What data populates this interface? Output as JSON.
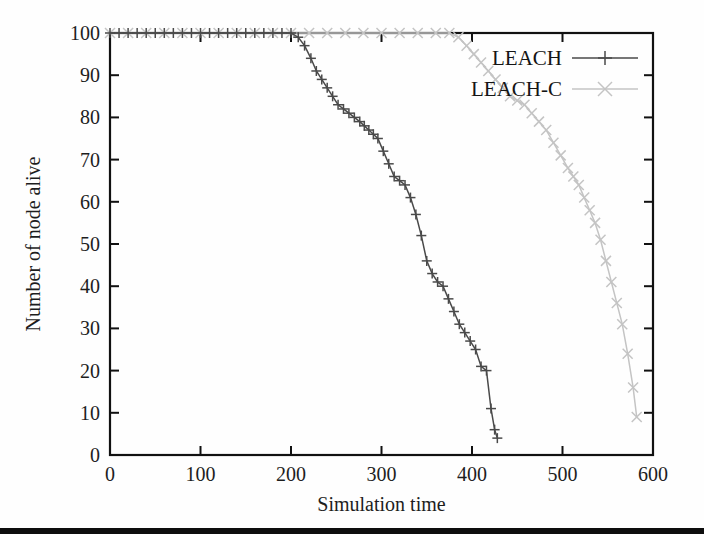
{
  "figure": {
    "background_color": "#fefefe",
    "frame_color": "#111111",
    "bottom_rule_color": "#0d0d0d"
  },
  "chart_data": {
    "type": "line",
    "title": "",
    "subtitle": "",
    "xlabel": "Simulation time",
    "ylabel": "Number of node alive",
    "xlim": [
      0,
      600
    ],
    "ylim": [
      0,
      100
    ],
    "xticks": [
      0,
      100,
      200,
      300,
      400,
      500,
      600
    ],
    "yticks": [
      0,
      10,
      20,
      30,
      40,
      50,
      60,
      70,
      80,
      90,
      100
    ],
    "xtick_labels": [
      "0",
      "100",
      "200",
      "300",
      "400",
      "500",
      "600"
    ],
    "ytick_labels": [
      "0",
      "10",
      "20",
      "30",
      "40",
      "50",
      "60",
      "70",
      "80",
      "90",
      "100"
    ],
    "grid": false,
    "legend_position": "top-right",
    "legend_entries": [
      "LEACH",
      "LEACH-C"
    ],
    "series": [
      {
        "name": "LEACH",
        "color": "#4a4a4a",
        "marker": "plus",
        "x": [
          0,
          10,
          20,
          30,
          40,
          50,
          60,
          70,
          80,
          90,
          100,
          110,
          120,
          130,
          140,
          150,
          160,
          170,
          180,
          190,
          200,
          208,
          215,
          222,
          228,
          234,
          240,
          246,
          252,
          258,
          264,
          270,
          276,
          281,
          286,
          291,
          296,
          302,
          308,
          314,
          320,
          326,
          332,
          338,
          344,
          350,
          356,
          362,
          368,
          374,
          380,
          386,
          392,
          398,
          404,
          410,
          416,
          421,
          425,
          428
        ],
        "y": [
          100,
          100,
          100,
          100,
          100,
          100,
          100,
          100,
          100,
          100,
          100,
          100,
          100,
          100,
          100,
          100,
          100,
          100,
          100,
          100,
          100,
          99,
          97,
          94,
          91,
          89,
          87,
          85,
          83,
          82,
          81,
          80,
          79,
          78,
          77,
          76,
          75,
          72,
          69,
          66,
          65,
          64,
          61,
          57,
          52,
          46,
          43,
          41,
          40,
          37,
          34,
          31,
          29,
          27,
          25,
          21,
          20,
          11,
          6,
          4
        ]
      },
      {
        "name": "LEACH-C",
        "color": "#c4c4c4",
        "marker": "cross",
        "x": [
          0,
          20,
          40,
          60,
          80,
          100,
          120,
          140,
          160,
          180,
          200,
          220,
          240,
          260,
          280,
          300,
          320,
          340,
          360,
          375,
          385,
          394,
          402,
          410,
          418,
          426,
          434,
          442,
          450,
          458,
          466,
          474,
          482,
          490,
          498,
          506,
          512,
          518,
          524,
          530,
          536,
          542,
          548,
          554,
          560,
          566,
          572,
          578,
          582
        ],
        "y": [
          100,
          100,
          100,
          100,
          100,
          100,
          100,
          100,
          100,
          100,
          100,
          100,
          100,
          100,
          100,
          100,
          100,
          100,
          100,
          100,
          99,
          97,
          95,
          93,
          91,
          89,
          87,
          85,
          84,
          83,
          81,
          79,
          77,
          74,
          71,
          68,
          66,
          64,
          61,
          58,
          55,
          51,
          46,
          41,
          36,
          31,
          24,
          16,
          9
        ]
      }
    ]
  },
  "axes": {
    "x_axis_label": "Simulation time",
    "y_axis_label": "Number of node alive"
  },
  "legend": {
    "items": [
      {
        "label": "LEACH",
        "marker": "plus-marker",
        "color": "#4a4a4a"
      },
      {
        "label": "LEACH-C",
        "marker": "cross-marker",
        "color": "#c4c4c4"
      }
    ]
  }
}
